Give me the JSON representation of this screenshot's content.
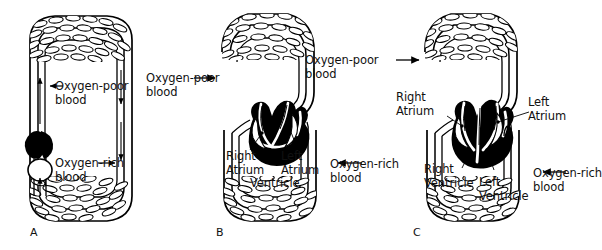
{
  "figure": {
    "type": "biology-diagram",
    "background_color": "#ffffff",
    "ink_color": "#000000",
    "panels": [
      {
        "letter": "A",
        "circulation": "single loop",
        "heart_chambers": 2,
        "labels": [
          {
            "name": "oxygen-poor-blood-internal",
            "text": "Oxygen-poor\nblood",
            "arrow": "left"
          },
          {
            "name": "oxygen-rich-blood-internal",
            "text": "Oxygen-rich\nblood",
            "arrow": "right"
          }
        ]
      },
      {
        "letter": "B",
        "circulation": "double loop",
        "heart_chambers": 3,
        "labels": [
          {
            "name": "right-atrium",
            "text": "Right\nAtrium"
          },
          {
            "name": "left-atrium",
            "text": "Left\nAtrium"
          },
          {
            "name": "ventricle",
            "text": "Ventricle"
          }
        ]
      },
      {
        "letter": "C",
        "circulation": "double loop",
        "heart_chambers": 4,
        "labels": [
          {
            "name": "right-atrium",
            "text": "Right\nAtrium"
          },
          {
            "name": "left-atrium",
            "text": "Left\nAtrium"
          },
          {
            "name": "right-ventricle",
            "text": "Right\nVentricle"
          },
          {
            "name": "left-ventricle",
            "text": "Left\nVentricle"
          }
        ]
      }
    ],
    "callouts": {
      "a_oxygen_poor_line1": "Oxygen-poor",
      "a_oxygen_poor_line2": "blood",
      "a_oxygen_rich_line1": "Oxygen-rich",
      "a_oxygen_rich_line2": "blood",
      "ab_oxygen_poor_line1": "Oxygen-poor",
      "ab_oxygen_poor_line2": "blood",
      "bc_oxygen_poor_line1": "Oxygen-poor",
      "bc_oxygen_poor_line2": "blood",
      "bc_oxygen_rich_line1": "Oxygen-rich",
      "bc_oxygen_rich_line2": "blood",
      "c_oxygen_rich_line1": "Oxygen-rich",
      "c_oxygen_rich_line2": "blood"
    },
    "chamber_labels": {
      "b_right_line1": "Right",
      "b_right_line2": "Atrium",
      "b_left_line1": "Left",
      "b_left_line2": "Atrium",
      "b_ventricle": "Ventricle",
      "c_right_atrium_line1": "Right",
      "c_right_atrium_line2": "Atrium",
      "c_left_atrium_line1": "Left",
      "c_left_atrium_line2": "Atrium",
      "c_right_ventricle_line1": "Right",
      "c_right_ventricle_line2": "Ventricle",
      "c_left_ventricle_line1": "Left",
      "c_left_ventricle_line2": "Ventricle"
    },
    "panel_letters": {
      "a": "A",
      "b": "B",
      "c": "C"
    }
  }
}
